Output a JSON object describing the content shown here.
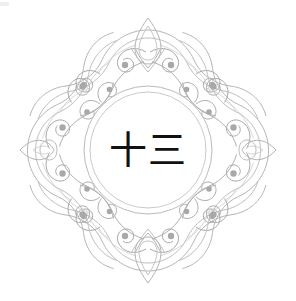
{
  "artwork": {
    "title": "Ornamental Filigree Medallion",
    "kind": "decorative-emblem",
    "canvas": {
      "width": 296,
      "height": 301,
      "background": "#ffffff"
    }
  },
  "center": {
    "text": "十三",
    "reading": "shi san",
    "meaning": "thirteen",
    "color": "#111111",
    "font_style": "serif"
  },
  "rings": {
    "outer": {
      "radius": 64,
      "stroke": "#b9b9b9",
      "stroke_width": 1
    },
    "inner": {
      "radius": 58,
      "stroke": "#c6c6c6",
      "stroke_width": 1
    },
    "center_x": 148,
    "center_y": 150
  },
  "ornament": {
    "stroke": "#b3b3b3",
    "stroke_accent": "#9a9a9a",
    "dot_fill": "#a8a8a8",
    "stroke_width": 1,
    "symmetry": "4-fold radial (diamond/star)",
    "points": [
      {
        "name": "top-finial",
        "x": 148,
        "y": 22
      },
      {
        "name": "right-finial",
        "x": 276,
        "y": 150
      },
      {
        "name": "bottom-finial",
        "x": 148,
        "y": 278
      },
      {
        "name": "left-finial",
        "x": 20,
        "y": 150
      }
    ]
  },
  "labels": {
    "emblem": "emblem",
    "frame": "ornamental-frame",
    "medallion": "center-medallion"
  }
}
